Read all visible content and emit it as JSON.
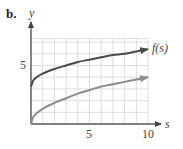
{
  "figure": {
    "part_label": "b.",
    "x_axis_label": "s",
    "y_axis_label": "y",
    "x_ticks": [
      {
        "value": 5,
        "label": "5"
      },
      {
        "value": 10,
        "label": "10"
      }
    ],
    "y_ticks": [
      {
        "value": 5,
        "label": "5"
      }
    ],
    "series_label": "f(s)"
  },
  "colors": {
    "axis": "#555555",
    "grid": "#dddddd",
    "series_f": "#4a4a4a",
    "series_g": "#8c8c8c"
  },
  "chart_data": {
    "type": "line",
    "title": "",
    "xlabel": "s",
    "ylabel": "y",
    "xlim": [
      0,
      10.5
    ],
    "ylim": [
      0,
      7.3
    ],
    "grid": true,
    "grid_step": 1,
    "x_tick_labels": [
      "5",
      "10"
    ],
    "y_tick_labels": [
      "5"
    ],
    "legend": "inline label at end of upper curve",
    "series": [
      {
        "name": "f(s)",
        "x": [
          0,
          0.25,
          1,
          2,
          3,
          4,
          5,
          6,
          7,
          8,
          9,
          10
        ],
        "values": [
          3.2,
          3.8,
          4.3,
          4.7,
          5.0,
          5.3,
          5.5,
          5.7,
          5.9,
          6.0,
          6.2,
          6.4
        ],
        "arrow_end": true
      },
      {
        "name": "unlabeled curve",
        "x": [
          0,
          0.25,
          1,
          2,
          3,
          4,
          5,
          6,
          7,
          8,
          9,
          10
        ],
        "values": [
          0.0,
          0.7,
          1.3,
          1.8,
          2.2,
          2.6,
          2.9,
          3.2,
          3.4,
          3.6,
          3.8,
          4.0
        ],
        "arrow_end": true
      }
    ]
  }
}
